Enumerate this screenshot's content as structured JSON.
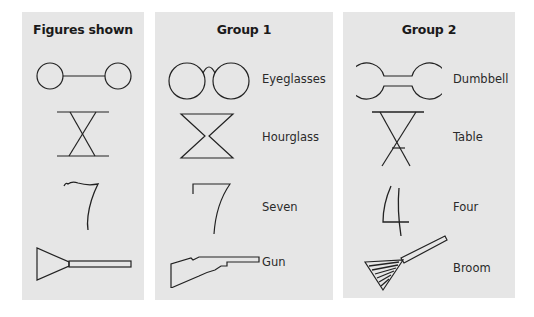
{
  "panels": [
    {
      "heading": "Figures shown",
      "items": [
        {
          "figure": "circles-connected-by-line-icon",
          "label": ""
        },
        {
          "figure": "crossed-x-between-bars-icon",
          "label": ""
        },
        {
          "figure": "wavy-seven-shape-icon",
          "label": ""
        },
        {
          "figure": "triangle-with-bar-icon",
          "label": ""
        }
      ]
    },
    {
      "heading": "Group 1",
      "items": [
        {
          "figure": "eyeglasses-icon",
          "label": "Eyeglasses"
        },
        {
          "figure": "hourglass-icon",
          "label": "Hourglass"
        },
        {
          "figure": "seven-icon",
          "label": "Seven"
        },
        {
          "figure": "gun-icon",
          "label": "Gun"
        }
      ]
    },
    {
      "heading": "Group 2",
      "items": [
        {
          "figure": "dumbbell-icon",
          "label": "Dumbbell"
        },
        {
          "figure": "table-icon",
          "label": "Table"
        },
        {
          "figure": "four-icon",
          "label": "Four"
        },
        {
          "figure": "broom-icon",
          "label": "Broom"
        }
      ]
    }
  ],
  "colors": {
    "panel_bg": "#e6e6e6",
    "stroke": "#222222",
    "page_bg": "#ffffff"
  }
}
